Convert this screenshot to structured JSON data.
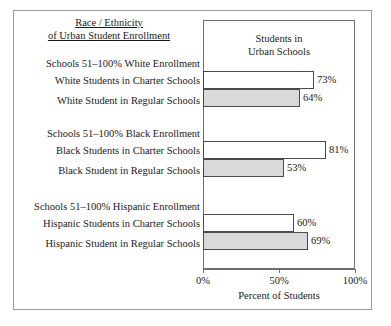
{
  "figure": {
    "title_lines": [
      "Race / Ethnicity",
      "of Urban Student Enrollment"
    ],
    "plot_header_lines": [
      "Students in",
      "Urban Schools"
    ],
    "axis_title": "Percent of Students",
    "colors": {
      "filled_bar": "#d9d9d9",
      "open_bar": "#ffffff",
      "bar_outline": "#4a4a4a",
      "frame": "#6e6e6e",
      "outer_frame": "#9a9a9a",
      "text": "#1a1a1a"
    }
  },
  "chart_data": {
    "type": "bar",
    "orientation": "horizontal",
    "title": "Race / Ethnicity of Urban Student Enrollment",
    "subtitle": "Students in Urban Schools",
    "xlabel": "Percent of Students",
    "ylabel": "",
    "xlim": [
      0,
      100
    ],
    "xticks": [
      0,
      50,
      100
    ],
    "xtick_labels": [
      "0%",
      "50%",
      "100%"
    ],
    "grid": false,
    "legend": "none",
    "groups": [
      {
        "header": "Schools 51–100% White Enrollment",
        "bars": [
          {
            "label": "White Students in Charter Schools",
            "value": 73,
            "value_label": "73%",
            "style": "open"
          },
          {
            "label": "White Student in Regular Schools",
            "value": 64,
            "value_label": "64%",
            "style": "filled"
          }
        ]
      },
      {
        "header": "Schools 51–100% Black Enrollment",
        "bars": [
          {
            "label": "Black Students in Charter Schools",
            "value": 81,
            "value_label": "81%",
            "style": "open"
          },
          {
            "label": "Black Student in Regular Schools",
            "value": 53,
            "value_label": "53%",
            "style": "filled"
          }
        ]
      },
      {
        "header": "Schools 51–100% Hispanic Enrollment",
        "bars": [
          {
            "label": "Hispanic Students in Charter Schools",
            "value": 60,
            "value_label": "60%",
            "style": "open"
          },
          {
            "label": "Hispanic Student in Regular Schools",
            "value": 69,
            "value_label": "69%",
            "style": "filled"
          }
        ]
      }
    ]
  }
}
